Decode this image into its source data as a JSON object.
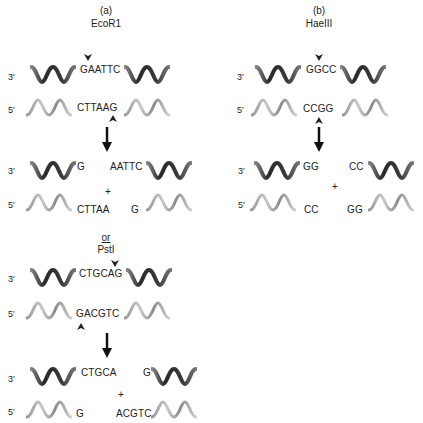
{
  "panel_a": {
    "label": "(a)",
    "enzyme": "EcoR1",
    "site_top": "GAATTC",
    "site_bottom": "CTTAAG",
    "product_left_top": "G",
    "product_left_bottom": "CTTAA",
    "product_right_top": "AATTC",
    "product_right_bottom": "G",
    "plus": "+",
    "or_label": "or",
    "enzyme2": "PstI",
    "site2_top": "CTGCAG",
    "site2_bottom": "GACGTC",
    "product2_left_top": "CTGCA",
    "product2_left_bottom": "G",
    "product2_right_top": "G",
    "product2_right_bottom": "ACGTC",
    "plus2": "+"
  },
  "panel_b": {
    "label": "(b)",
    "enzyme": "HaeIII",
    "site_top": "GGCC",
    "site_bottom": "CCGG",
    "product_left_top": "GG",
    "product_left_bottom": "CC",
    "product_right_top": "CC",
    "product_right_bottom": "GG",
    "plus": "+"
  },
  "strand_ends": {
    "top": "3′",
    "bottom": "5′"
  },
  "colors": {
    "top_strand": "#3a3a3a",
    "bottom_strand": "#a8a8a8",
    "text": "#222222",
    "arrow": "#111111"
  }
}
